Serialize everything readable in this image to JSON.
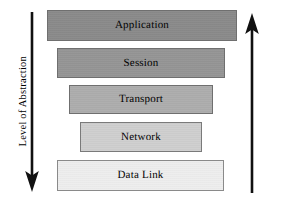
{
  "diagram": {
    "background_color": "#ffffff",
    "width": 285,
    "height": 205
  },
  "layers": [
    {
      "label": "Application",
      "fill": "#8a8a8a",
      "border": "#6f6f6f",
      "x": 47,
      "y": 10,
      "width": 190,
      "height": 31,
      "order": 1
    },
    {
      "label": "Session",
      "fill": "#959595",
      "border": "#6f6f6f",
      "x": 57,
      "y": 48,
      "width": 168,
      "height": 30,
      "order": 2
    },
    {
      "label": "Transport",
      "fill": "#adadad",
      "border": "#6f6f6f",
      "x": 69,
      "y": 85,
      "width": 144,
      "height": 29,
      "order": 3
    },
    {
      "label": "Network",
      "fill": "#cfcfcf",
      "border": "#7a7a7a",
      "x": 80,
      "y": 122,
      "width": 122,
      "height": 30,
      "order": 4
    },
    {
      "label": "Data Link",
      "fill": "#eeeeee",
      "border": "#8a8a8a",
      "x": 57,
      "y": 160,
      "width": 167,
      "height": 31,
      "order": 5
    }
  ],
  "axes": {
    "left": {
      "label": "Level of Abstraction",
      "direction": "down",
      "color": "#111111",
      "arrow_x": 32,
      "arrow_top": 12,
      "arrow_bottom": 191
    },
    "right": {
      "label": "Granularity / Adaptability",
      "direction": "up",
      "color": "#111111",
      "arrow_x": 24,
      "arrow_top": 14,
      "arrow_bottom": 193
    }
  }
}
